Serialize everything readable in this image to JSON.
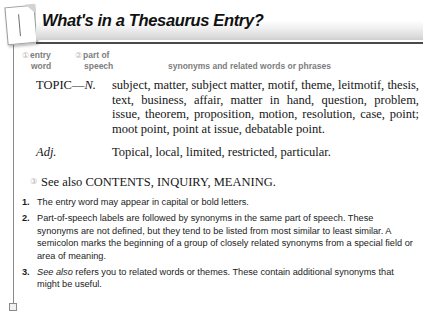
{
  "header": {
    "title": "What's in a Thesaurus Entry?",
    "page_icon": "page-corner-icon"
  },
  "column_labels": {
    "entry_word": {
      "marker": "①",
      "line1": "entry",
      "line2": "word"
    },
    "part_of_speech": {
      "marker": "②",
      "line1": "part of",
      "line2": "speech"
    },
    "synonyms": "synonyms and related words or phrases"
  },
  "entry": {
    "noun": {
      "pos_label_main": "TOPIC—",
      "pos_label_ital": "N.",
      "synonyms": "subject, matter, subject matter, motif, theme, leitmotif, thesis, text, business, affair, matter in hand, question, problem, issue, theorem, proposition, motion, resolution, case, point; moot point, point at issue, debatable point."
    },
    "adjective": {
      "pos_label_ital": "Adj.",
      "synonyms": "Topical, local, limited, restricted, particular."
    },
    "see_also": {
      "marker": "③",
      "text": "See also CONTENTS, INQUIRY, MEANING."
    }
  },
  "notes": [
    {
      "number": "1.",
      "text": "The entry word may appear in capital or bold letters.",
      "italic_lead": ""
    },
    {
      "number": "2.",
      "text": "Part-of-speech labels are followed by synonyms in the same part of speech. These synonyms are not defined, but they tend to be listed from most similar to least similar. A semicolon marks the beginning of a group of closely related synonyms from a special field or area of meaning.",
      "italic_lead": ""
    },
    {
      "number": "3.",
      "text": " refers you to related words or themes. These contain additional synonyms that might be useful.",
      "italic_lead": "See also"
    }
  ],
  "colors": {
    "rule": "#4a4a4a",
    "label_gray": "#7d7d7d",
    "marker_gray": "#b4b4b4",
    "margin_rule": "#8a8a8a",
    "text": "#161616"
  }
}
